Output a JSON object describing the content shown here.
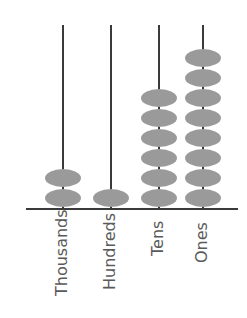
{
  "colors": {
    "rod": "#3a3a3a",
    "bead": "#9a9a9a",
    "label": "#5a5a5a"
  },
  "columns": [
    {
      "label": "Thousands",
      "beads": 2,
      "x": 63
    },
    {
      "label": "Hundreds",
      "beads": 1,
      "x": 111
    },
    {
      "label": "Tens",
      "beads": 6,
      "x": 159
    },
    {
      "label": "Ones",
      "beads": 8,
      "x": 203
    }
  ],
  "value": 2168
}
